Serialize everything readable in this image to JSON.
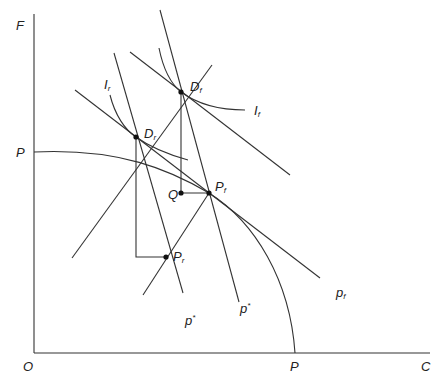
{
  "diagram": {
    "type": "trade-theory-ppf",
    "axes": {
      "y_label": "F",
      "x_label": "C",
      "origin_label": "O",
      "y_intercept_label": "P",
      "x_intercept_label": "P"
    },
    "points": {
      "Df": {
        "main": "D",
        "sub": "f"
      },
      "Dr": {
        "main": "D",
        "sub": "r"
      },
      "Pf": {
        "main": "P",
        "sub": "f"
      },
      "Pr": {
        "main": "P",
        "sub": "r"
      },
      "Q": {
        "main": "Q"
      }
    },
    "curves": {
      "Ir": {
        "main": "I",
        "sub": "r"
      },
      "If": {
        "main": "I",
        "sub": "f"
      },
      "p_star_1": {
        "main": "p",
        "sup": "*"
      },
      "p_star_2": {
        "main": "p",
        "sup": "*"
      },
      "pf": {
        "main": "p",
        "sub": "f"
      }
    },
    "colors": {
      "line": "#333333",
      "text": "#222222",
      "background": "#ffffff"
    }
  }
}
